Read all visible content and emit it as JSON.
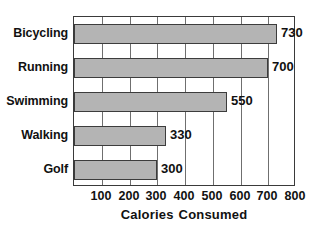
{
  "chart_data": {
    "type": "bar",
    "orientation": "horizontal",
    "title": "",
    "xlabel": "Calories Consumed",
    "ylabel": "",
    "categories": [
      "Bicycling",
      "Running",
      "Swimming",
      "Walking",
      "Golf"
    ],
    "values": [
      730,
      700,
      550,
      330,
      300
    ],
    "data_labels": [
      "730",
      "700",
      "550",
      "330",
      "300"
    ],
    "xlim": [
      0,
      800
    ],
    "xticks": [
      100,
      200,
      300,
      400,
      500,
      600,
      700,
      800
    ],
    "xtick_labels": [
      "100",
      "200",
      "300",
      "400",
      "500",
      "600",
      "700",
      "800"
    ],
    "grid": "vertical",
    "legend": null,
    "bar_color": "#b4b4b4",
    "bar_border_color": "#3c3c3c",
    "axis_color": "#3a3a3a",
    "grid_color": "#6f6f6f",
    "background_color": "#ffffff"
  },
  "axis_title_parts": {
    "word1": "Calories",
    "word2": "Consumed"
  }
}
